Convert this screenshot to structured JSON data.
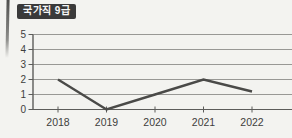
{
  "badge": {
    "label": "국가직 9급"
  },
  "colors": {
    "background": "#f3f3f0",
    "badge_bg": "#3a3a3a",
    "badge_text": "#f7f7f7",
    "grid": "#98989500",
    "grid_line": "#989895",
    "axis": "#5c5c5a",
    "tick_label": "#3e3e3c",
    "data_line": "#4a4a48"
  },
  "chart_data": {
    "type": "line",
    "title": "국가직 9급",
    "categories": [
      "2018",
      "2019",
      "2020",
      "2021",
      "2022"
    ],
    "values": [
      2,
      0,
      1,
      2,
      1.2
    ],
    "xlabel": "",
    "ylabel": "",
    "ylim": [
      0,
      5
    ],
    "yticks": [
      0,
      1,
      2,
      3,
      4,
      5
    ],
    "grid": "horizontal",
    "legend": "none"
  }
}
